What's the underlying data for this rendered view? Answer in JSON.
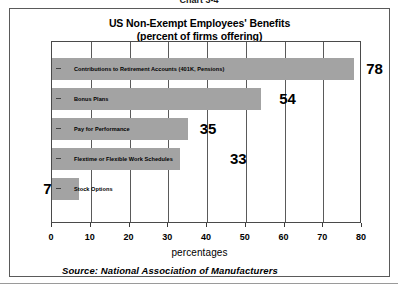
{
  "caption": "Chart 3-4",
  "chart_data": {
    "type": "bar",
    "orientation": "horizontal",
    "title": "US Non-Exempt Employees' Benefits",
    "subtitle": "(percent of firms offering)",
    "xlabel": "percentages",
    "ylabel": "",
    "xlim": [
      0,
      80
    ],
    "xticks": [
      0,
      10,
      20,
      30,
      40,
      50,
      60,
      70,
      80
    ],
    "grid": true,
    "legend": false,
    "bar_color": "#a3a3a3",
    "categories": [
      "Contributions to Retirement Accounts (401K, Pensions)",
      "Bonus Plans",
      "Pay for Performance",
      "Flextime or Flexible Work Schedules",
      "Stock Options"
    ],
    "values": [
      78,
      54,
      35,
      33,
      7
    ],
    "value_labels": [
      "78",
      "54",
      "35",
      "33",
      "7"
    ],
    "source": "Source:  National Association of Manufacturers"
  }
}
